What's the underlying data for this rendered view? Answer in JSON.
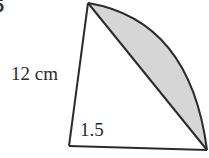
{
  "question_number": "5",
  "labels": {
    "side_length": "12 cm",
    "angle": "1.5"
  },
  "colors": {
    "stroke": "#2b2b2b",
    "shaded_segment": "#d6d6d6",
    "background": "#ffffff"
  },
  "figure": {
    "type": "sector with shaded segment",
    "radius": "12 cm",
    "angle_radians": "1.5"
  }
}
